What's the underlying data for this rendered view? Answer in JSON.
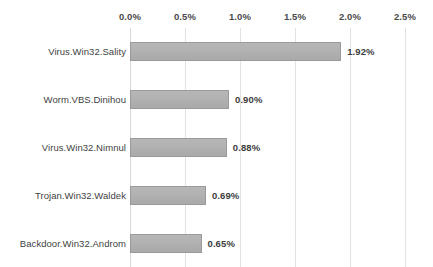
{
  "chart_data": {
    "type": "bar",
    "orientation": "horizontal",
    "title": "",
    "subtitle": "",
    "xlabel": "",
    "ylabel": "",
    "categories": [
      "Virus.Win32.Sality",
      "Worm.VBS.Dinihou",
      "Virus.Win32.Nimnul",
      "Trojan.Win32.Waldek",
      "Backdoor.Win32.Androm"
    ],
    "values": [
      1.92,
      0.9,
      0.88,
      0.69,
      0.65
    ],
    "value_labels": [
      "1.92%",
      "0.90%",
      "0.88%",
      "0.69%",
      "0.65%"
    ],
    "xlim": [
      0.0,
      2.5
    ],
    "xtick_values": [
      0.0,
      0.5,
      1.0,
      1.5,
      2.0,
      2.5
    ],
    "xtick_labels": [
      "0.0%",
      "0.5%",
      "1.0%",
      "1.5%",
      "2.0%",
      "2.5%"
    ],
    "grid": true,
    "grid_axis": "x",
    "legend": false,
    "legend_position": "none",
    "axis_position": "top",
    "colors": {
      "bar_fill": "#b0b0b0",
      "bar_border": "#9a9a9a",
      "gridline": "#e2e2e2",
      "tick_label": "#4a4a4a",
      "category_label": "#3f3f3f",
      "value_label": "#3d3d3d",
      "background": "#ffffff"
    }
  }
}
